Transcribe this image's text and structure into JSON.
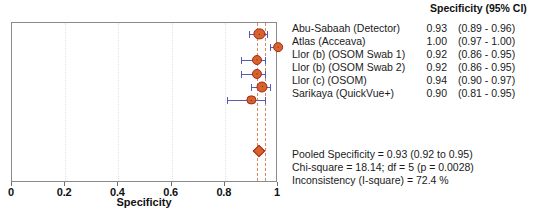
{
  "chart_data": {
    "type": "forest",
    "title": "",
    "xlabel": "Specificity",
    "ylabel": "",
    "xlim": [
      0,
      1
    ],
    "xticks": [
      0,
      0.2,
      0.4,
      0.6,
      0.8,
      1
    ],
    "xticklabels": [
      "0",
      "0.2",
      "0.4",
      "0.6",
      "0.8",
      "1"
    ],
    "grid": true,
    "legend": "none",
    "column_header": "Specificity (95% CI)",
    "studies": [
      {
        "label": "Abu-Sabaah (Detector)",
        "estimate": 0.93,
        "estimate_text": "0.93",
        "ci_low": 0.89,
        "ci_high": 0.96,
        "ci_text": "(0.89 - 0.96)",
        "weight": 0.85
      },
      {
        "label": "Atlas (Acceava)",
        "estimate": 1.0,
        "estimate_text": "1.00",
        "ci_low": 0.97,
        "ci_high": 1.0,
        "ci_text": "(0.97 - 1.00)",
        "weight": 0.55
      },
      {
        "label": "Llor (b) (OSOM Swab 1)",
        "estimate": 0.92,
        "estimate_text": "0.92",
        "ci_low": 0.86,
        "ci_high": 0.95,
        "ci_text": "(0.86 - 0.95)",
        "weight": 0.6
      },
      {
        "label": "Llor (b) (OSOM Swab 2)",
        "estimate": 0.92,
        "estimate_text": "0.92",
        "ci_low": 0.86,
        "ci_high": 0.95,
        "ci_text": "(0.86 - 0.95)",
        "weight": 0.62
      },
      {
        "label": "Llor (c) (OSOM)",
        "estimate": 0.94,
        "estimate_text": "0.94",
        "ci_low": 0.9,
        "ci_high": 0.97,
        "ci_text": "(0.90 - 0.97)",
        "weight": 0.8
      },
      {
        "label": "Sarikaya (QuickVue+)",
        "estimate": 0.9,
        "estimate_text": "0.90",
        "ci_low": 0.81,
        "ci_high": 0.95,
        "ci_text": "(0.81 - 0.95)",
        "weight": 0.45
      }
    ],
    "pooled": {
      "estimate": 0.93,
      "ci_low": 0.92,
      "ci_high": 0.95
    },
    "colors": {
      "marker_fill": "#d9622b",
      "marker_edge": "#9e2b1e",
      "ci_line": "#5a5ab4",
      "reference_line": "#d9885f",
      "axis": "#8a8a8a"
    }
  },
  "summary": {
    "pooled_line": "Pooled Specificity = 0.93 (0.92 to 0.95)",
    "chisq_line": "Chi-square = 18.14; df =  5 (p = 0.0028)",
    "inconsistency_line": "Inconsistency (I-square) = 72.4 %"
  }
}
